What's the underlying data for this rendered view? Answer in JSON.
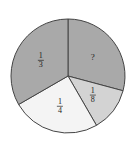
{
  "chart_data": {
    "type": "pie",
    "title": "",
    "center": [
      68,
      76
    ],
    "radius": 57,
    "start_angle_deg": -90,
    "slices": [
      {
        "label": "?",
        "value": 0.2917,
        "display": "?",
        "color": "#a9a9a9"
      },
      {
        "label": "1/8",
        "value": 0.125,
        "display_num": "1",
        "display_den": "8",
        "color": "#d3d3d3"
      },
      {
        "label": "1/4",
        "value": 0.25,
        "display_num": "1",
        "display_den": "4",
        "color": "#f4f4f4"
      },
      {
        "label": "1/3",
        "value": 0.3333,
        "display_num": "1",
        "display_den": "3",
        "color": "#a9a9a9"
      }
    ],
    "stroke_color": "#444444"
  }
}
